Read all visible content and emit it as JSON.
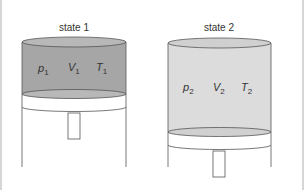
{
  "diagram": {
    "states": [
      {
        "title": "state 1",
        "variables": [
          {
            "symbol": "p",
            "subscript": "1"
          },
          {
            "symbol": "V",
            "subscript": "1"
          },
          {
            "symbol": "T",
            "subscript": "1"
          }
        ],
        "gas_color": "#a6a6a6"
      },
      {
        "title": "state 2",
        "variables": [
          {
            "symbol": "p",
            "subscript": "2"
          },
          {
            "symbol": "V",
            "subscript": "2"
          },
          {
            "symbol": "T",
            "subscript": "2"
          }
        ],
        "gas_color": "#dcdcdc"
      }
    ]
  }
}
